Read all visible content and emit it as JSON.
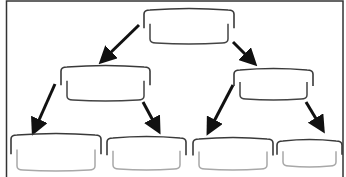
{
  "diagram": {
    "type": "tree",
    "colors": {
      "border": "#333333",
      "bracket_top": "#3a3a3a",
      "bracket_bottom_dark": "#444444",
      "bracket_bottom_light": "#a8a8a8",
      "arrow": "#111111"
    },
    "nodes": [
      {
        "id": "root",
        "level": 0,
        "label": ""
      },
      {
        "id": "left",
        "level": 1,
        "parent": "root",
        "label": ""
      },
      {
        "id": "right",
        "level": 1,
        "parent": "root",
        "label": ""
      },
      {
        "id": "left-left",
        "level": 2,
        "parent": "left",
        "label": ""
      },
      {
        "id": "left-right",
        "level": 2,
        "parent": "left",
        "label": ""
      },
      {
        "id": "right-left",
        "level": 2,
        "parent": "right",
        "label": ""
      },
      {
        "id": "right-right",
        "level": 2,
        "parent": "right",
        "label": ""
      }
    ],
    "edges": [
      {
        "from": "root",
        "to": "left"
      },
      {
        "from": "root",
        "to": "right"
      },
      {
        "from": "left",
        "to": "left-left"
      },
      {
        "from": "left",
        "to": "left-right"
      },
      {
        "from": "right",
        "to": "right-left"
      },
      {
        "from": "right",
        "to": "right-right"
      }
    ]
  }
}
